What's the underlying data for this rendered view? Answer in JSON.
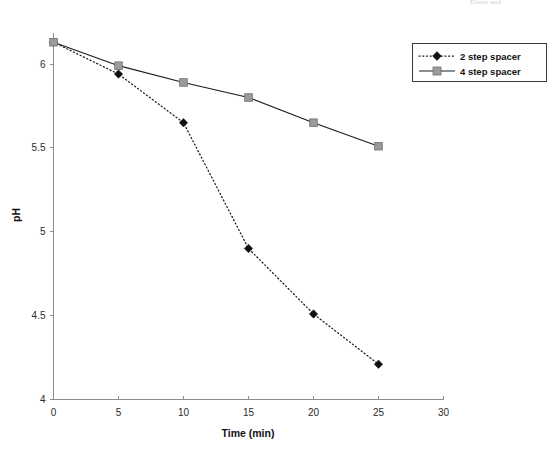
{
  "header_artifact": "Dates and",
  "chart_data": {
    "type": "line",
    "title": "",
    "xlabel": "Time (min)",
    "ylabel": "pH",
    "x": [
      0,
      5,
      10,
      15,
      20,
      25
    ],
    "xlim": [
      0,
      30
    ],
    "ylim": [
      4,
      6.25
    ],
    "xticks": [
      0,
      5,
      10,
      15,
      20,
      25,
      30
    ],
    "xtick_labels": [
      "0",
      "5",
      "10",
      "15",
      "20",
      "25",
      "30"
    ],
    "yticks": [
      4,
      4.5,
      5,
      5.5,
      6
    ],
    "ytick_labels": [
      "4",
      "4.5",
      "5",
      "5.5",
      "6"
    ],
    "grid": false,
    "legend_position": "upper right",
    "series": [
      {
        "name": "2 step spacer",
        "values": [
          6.13,
          5.94,
          5.65,
          4.9,
          4.51,
          4.21
        ],
        "line_style": "dotted",
        "marker": "diamond",
        "color": "#111111"
      },
      {
        "name": "4 step spacer",
        "values": [
          6.13,
          5.99,
          5.89,
          5.8,
          5.65,
          5.51
        ],
        "line_style": "solid",
        "marker": "square",
        "color": "#9b9b9b"
      }
    ]
  },
  "legend": {
    "entries": [
      {
        "label": "2 step spacer"
      },
      {
        "label": "4 step spacer"
      }
    ]
  }
}
